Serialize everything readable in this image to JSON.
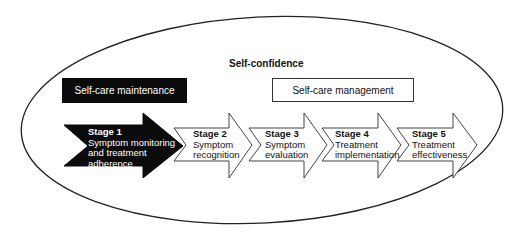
{
  "diagram": {
    "outer_label": "Self-confidence",
    "boxes": [
      {
        "label": "Self-care maintenance",
        "style": "filled-black"
      },
      {
        "label": "Self-care management",
        "style": "outlined-white"
      }
    ],
    "stages": [
      {
        "stage": "Stage 1",
        "lines": [
          "Symptom monitoring",
          "and treatment",
          "adherence"
        ],
        "style": "filled-black"
      },
      {
        "stage": "Stage 2",
        "lines": [
          "Symptom",
          "recognition"
        ],
        "style": "outlined-white"
      },
      {
        "stage": "Stage 3",
        "lines": [
          "Symptom",
          "evaluation"
        ],
        "style": "outlined-white"
      },
      {
        "stage": "Stage 4",
        "lines": [
          "Treatment",
          "implementation"
        ],
        "style": "outlined-white"
      },
      {
        "stage": "Stage 5",
        "lines": [
          "Treatment",
          "effectiveness"
        ],
        "style": "outlined-white"
      }
    ],
    "colors": {
      "dark": "#0b0b0b",
      "line": "#222222",
      "background": "#ffffff"
    }
  }
}
